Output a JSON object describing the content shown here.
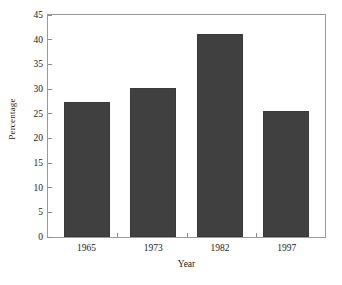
{
  "chart_data": {
    "type": "bar",
    "title": "",
    "xlabel": "Year",
    "ylabel": "Percentage",
    "categories": [
      "1965",
      "1973",
      "1982",
      "1997"
    ],
    "values": [
      27.4,
      30.3,
      41.1,
      25.5
    ],
    "ylim": [
      0,
      45
    ],
    "ytick_step": 5,
    "yticks": [
      "0",
      "5",
      "10",
      "15",
      "20",
      "25",
      "30",
      "35",
      "40",
      "45"
    ],
    "grid": false,
    "legend": "none",
    "bar_color": "#404040",
    "frame_color": "#9a9a9a",
    "background": "#ffffff"
  }
}
